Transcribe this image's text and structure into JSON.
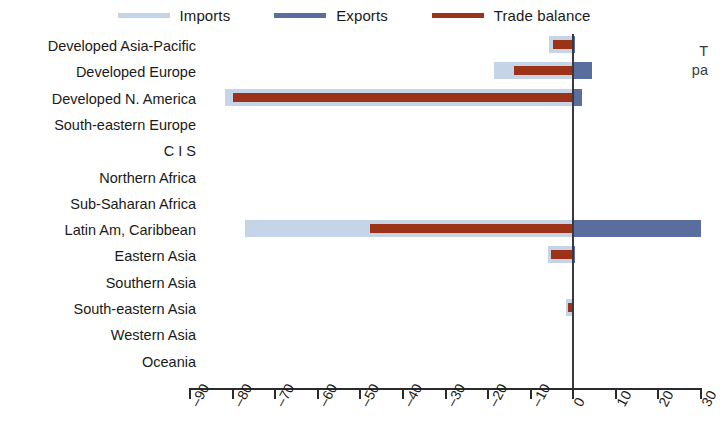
{
  "legend": {
    "items": [
      {
        "label": "Imports",
        "color": "#c6d4e8",
        "name": "imports"
      },
      {
        "label": "Exports",
        "color": "#5a6e9e",
        "name": "exports"
      },
      {
        "label": "Trade balance",
        "color": "#9c3319",
        "name": "trade-balance"
      }
    ]
  },
  "side_note": {
    "line1": "T",
    "line2": "pa"
  },
  "chart_data": {
    "type": "bar",
    "orientation": "horizontal",
    "title": "",
    "subtitle": "",
    "xlabel": "",
    "ylabel": "",
    "xlim": [
      -90,
      30
    ],
    "xticks": [
      -90,
      -80,
      -70,
      -60,
      -50,
      -40,
      -30,
      -20,
      -10,
      0,
      10,
      20,
      30
    ],
    "xtick_labels": [
      "-90",
      "-80",
      "-70",
      "-60",
      "-50",
      "-40",
      "-30",
      "-20",
      "-10",
      "0",
      "10",
      "20",
      "30"
    ],
    "grid": false,
    "legend_position": "top",
    "categories": [
      "Developed Asia-Pacific",
      "Developed Europe",
      "Developed N. America",
      "South-eastern Europe",
      "C I S",
      "Northern Africa",
      "Sub-Saharan Africa",
      "Latin Am, Caribbean",
      "Eastern Asia",
      "Southern Asia",
      "South-eastern Asia",
      "Western Asia",
      "Oceania"
    ],
    "series": [
      {
        "name": "Imports",
        "color": "#c6d4e8",
        "values": [
          -5.6,
          -18.5,
          -81.7,
          0,
          0,
          0,
          0,
          -77.0,
          -6.0,
          0,
          -1.6,
          0,
          0
        ]
      },
      {
        "name": "Exports",
        "color": "#5a6e9e",
        "values": [
          0.3,
          4.5,
          2.0,
          0,
          0,
          0,
          0,
          30.0,
          0.4,
          0,
          0.2,
          0,
          0
        ]
      },
      {
        "name": "Trade balance",
        "color": "#9c3319",
        "values": [
          -4.8,
          -14.0,
          -80.0,
          0,
          0,
          0,
          0,
          -47.8,
          -5.2,
          0,
          -1.2,
          0,
          0
        ]
      }
    ]
  },
  "colors": {
    "imports": "#c6d4e8",
    "exports": "#5a6e9e",
    "balance": "#9c3319",
    "axis": "#2b2b2e",
    "zero_line": "#3a3a3e"
  }
}
